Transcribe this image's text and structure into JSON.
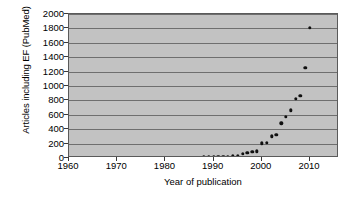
{
  "chart_data": {
    "type": "scatter",
    "title": "",
    "xlabel": "Year of publication",
    "ylabel": "Articles including EF (PubMed)",
    "xlim": [
      1960,
      2016
    ],
    "ylim": [
      0,
      2000
    ],
    "xticks": [
      1960,
      1970,
      1980,
      1990,
      2000,
      2010
    ],
    "yticks": [
      0,
      200,
      400,
      600,
      800,
      1000,
      1200,
      1400,
      1600,
      1800,
      2000
    ],
    "grid": "horizontal",
    "legend": "none",
    "marker": "filled-diamond",
    "marker_color": "#101010",
    "plot_background": "#c2c2c2",
    "gridline_color": "#6e6e6e",
    "border_color": "#5a5a5a",
    "page_background": "#ffffff",
    "series": [
      {
        "name": "Articles including EF (PubMed)",
        "points": [
          [
            1960,
            2
          ],
          [
            1969,
            3
          ],
          [
            1972,
            3
          ],
          [
            1983,
            4
          ],
          [
            1984,
            5
          ],
          [
            1986,
            5
          ],
          [
            1988,
            8
          ],
          [
            1989,
            10
          ],
          [
            1990,
            12
          ],
          [
            1991,
            14
          ],
          [
            1992,
            17
          ],
          [
            1993,
            20
          ],
          [
            1994,
            24
          ],
          [
            1995,
            34
          ],
          [
            1996,
            55
          ],
          [
            1997,
            75
          ],
          [
            1998,
            88
          ],
          [
            1999,
            92
          ],
          [
            2000,
            205
          ],
          [
            2001,
            210
          ],
          [
            2002,
            300
          ],
          [
            2003,
            325
          ],
          [
            2004,
            480
          ],
          [
            2005,
            575
          ],
          [
            2006,
            665
          ],
          [
            2007,
            820
          ],
          [
            2008,
            860
          ],
          [
            2009,
            1255
          ],
          [
            2010,
            1810
          ]
        ]
      }
    ]
  }
}
